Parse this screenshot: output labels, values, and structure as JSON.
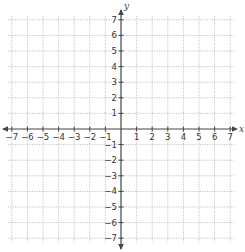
{
  "graph": {
    "x_axis_label": "x",
    "y_axis_label": "y",
    "x_range": [
      -7,
      7
    ],
    "y_range": [
      -7,
      7
    ],
    "x_tick_labels": [
      "-7",
      "-6",
      "-5",
      "-4",
      "-3",
      "-2",
      "-1",
      "1",
      "2",
      "3",
      "4",
      "5",
      "6",
      "7"
    ],
    "y_tick_labels": [
      "7",
      "6",
      "5",
      "4",
      "3",
      "2",
      "1",
      "-1",
      "-2",
      "-3",
      "-4",
      "-5",
      "-6",
      "-7"
    ],
    "colors": {
      "axis": "#444444",
      "grid": "#b5b5b5",
      "labels": "#333333"
    }
  }
}
